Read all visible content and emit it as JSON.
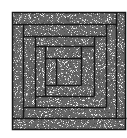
{
  "figure": {
    "canvas": {
      "width": 127,
      "height": 138
    },
    "background_color": "#ffffff",
    "texture": {
      "base_color": "#666666",
      "speckle_color": "#f0f0f0",
      "density": 0.16,
      "seed": 7
    },
    "line_color": "#161616",
    "line_width": 1.5,
    "outer_box": {
      "x1": 12,
      "y1": 12,
      "x2": 126,
      "y2": 130
    },
    "segments": [
      {
        "x1": 12,
        "y1": 24,
        "x2": 116,
        "y2": 24
      },
      {
        "x1": 116,
        "y1": 12,
        "x2": 116,
        "y2": 118
      },
      {
        "x1": 12,
        "y1": 118,
        "x2": 126,
        "y2": 118
      },
      {
        "x1": 23,
        "y1": 24,
        "x2": 23,
        "y2": 118
      },
      {
        "x1": 23,
        "y1": 36,
        "x2": 106,
        "y2": 36
      },
      {
        "x1": 106,
        "y1": 24,
        "x2": 106,
        "y2": 107
      },
      {
        "x1": 23,
        "y1": 107,
        "x2": 106,
        "y2": 107
      },
      {
        "x1": 35,
        "y1": 36,
        "x2": 35,
        "y2": 107
      },
      {
        "x1": 35,
        "y1": 46,
        "x2": 94,
        "y2": 46
      },
      {
        "x1": 94,
        "y1": 36,
        "x2": 94,
        "y2": 96
      },
      {
        "x1": 35,
        "y1": 96,
        "x2": 94,
        "y2": 96
      },
      {
        "x1": 45,
        "y1": 46,
        "x2": 45,
        "y2": 96
      },
      {
        "x1": 45,
        "y1": 58,
        "x2": 81,
        "y2": 58
      },
      {
        "x1": 81,
        "y1": 46,
        "x2": 81,
        "y2": 85
      },
      {
        "x1": 45,
        "y1": 85,
        "x2": 81,
        "y2": 85
      },
      {
        "x1": 56,
        "y1": 58,
        "x2": 56,
        "y2": 85
      }
    ]
  }
}
